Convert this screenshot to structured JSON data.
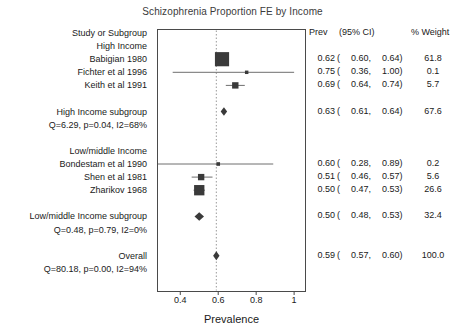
{
  "chart_data": {
    "type": "forest",
    "title": "Schizophrenia Proportion FE by Income",
    "xlabel": "Prevalence",
    "ylabel": "",
    "xlim": [
      0.28,
      1.06
    ],
    "xticks": [
      0.4,
      0.6,
      0.8,
      1
    ],
    "xtick_labels": [
      "0.4",
      "0.6",
      "0.8",
      "1"
    ],
    "grid": false,
    "reference_line": 0.59,
    "columns": {
      "study": "Study or Subgroup",
      "prev": "Prev",
      "ci": "(95% CI)",
      "weight": "% Weight"
    },
    "rows": [
      {
        "kind": "header",
        "label": "Study or Subgroup",
        "prev": "Prev",
        "ci": "(95% CI)",
        "weight": "% Weight"
      },
      {
        "kind": "group",
        "label": "High Income"
      },
      {
        "kind": "study",
        "label": "Babigian 1980",
        "prev": 0.62,
        "ci_low": 0.6,
        "ci_high": 0.64,
        "weight": 61.8,
        "prev_text": "0.62",
        "ci_low_text": "0.60",
        "ci_high_text": "0.64",
        "weight_text": "61.8"
      },
      {
        "kind": "study",
        "label": "Fichter et al 1996",
        "prev": 0.75,
        "ci_low": 0.36,
        "ci_high": 1.0,
        "weight": 0.1,
        "prev_text": "0.75",
        "ci_low_text": "0.36",
        "ci_high_text": "1.00",
        "weight_text": "0.1"
      },
      {
        "kind": "study",
        "label": "Keith et al 1991",
        "prev": 0.69,
        "ci_low": 0.64,
        "ci_high": 0.74,
        "weight": 5.7,
        "prev_text": "0.69",
        "ci_low_text": "0.64",
        "ci_high_text": "0.74",
        "weight_text": "5.7"
      },
      {
        "kind": "spacer"
      },
      {
        "kind": "subtotal",
        "label": "High Income subgroup",
        "prev": 0.63,
        "ci_low": 0.61,
        "ci_high": 0.64,
        "weight": 67.6,
        "prev_text": "0.63",
        "ci_low_text": "0.61",
        "ci_high_text": "0.64",
        "weight_text": "67.6"
      },
      {
        "kind": "het",
        "label": "Q=6.29, p=0.04, I2=68%"
      },
      {
        "kind": "spacer"
      },
      {
        "kind": "group",
        "label": "Low/middle Income"
      },
      {
        "kind": "study",
        "label": "Bondestam et al 1990",
        "prev": 0.6,
        "ci_low": 0.28,
        "ci_high": 0.89,
        "weight": 0.2,
        "prev_text": "0.60",
        "ci_low_text": "0.28",
        "ci_high_text": "0.89",
        "weight_text": "0.2"
      },
      {
        "kind": "study",
        "label": "Shen et al 1981",
        "prev": 0.51,
        "ci_low": 0.46,
        "ci_high": 0.57,
        "weight": 5.6,
        "prev_text": "0.51",
        "ci_low_text": "0.46",
        "ci_high_text": "0.57",
        "weight_text": "5.6"
      },
      {
        "kind": "study",
        "label": "Zharikov 1968",
        "prev": 0.5,
        "ci_low": 0.47,
        "ci_high": 0.53,
        "weight": 26.6,
        "prev_text": "0.50",
        "ci_low_text": "0.47",
        "ci_high_text": "0.53",
        "weight_text": "26.6"
      },
      {
        "kind": "spacer"
      },
      {
        "kind": "subtotal",
        "label": "Low/middle Income subgroup",
        "prev": 0.5,
        "ci_low": 0.48,
        "ci_high": 0.53,
        "weight": 32.4,
        "prev_text": "0.50",
        "ci_low_text": "0.48",
        "ci_high_text": "0.53",
        "weight_text": "32.4"
      },
      {
        "kind": "het",
        "label": "Q=0.48, p=0.79, I2=0%"
      },
      {
        "kind": "spacer"
      },
      {
        "kind": "total",
        "label": "Overall",
        "prev": 0.59,
        "ci_low": 0.57,
        "ci_high": 0.6,
        "weight": 100.0,
        "prev_text": "0.59",
        "ci_low_text": "0.57",
        "ci_high_text": "0.60",
        "weight_text": "100.0"
      },
      {
        "kind": "het",
        "label": "Q=80.18, p=0.00, I2=94%"
      }
    ],
    "colors": {
      "marker": "#3a3a3a",
      "line": "#6e6e6e",
      "frame": "#4a4a4a",
      "reference": "#9a9a9a",
      "title": "#3b3b3b",
      "text": "#1a1a1a"
    }
  }
}
